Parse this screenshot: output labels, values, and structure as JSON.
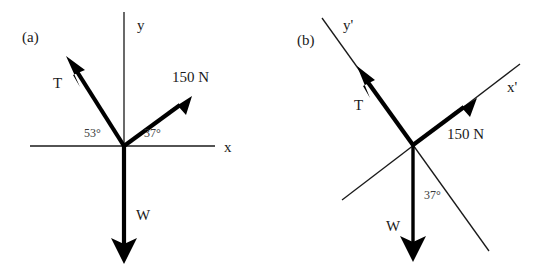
{
  "figure": {
    "background_color": "#ffffff",
    "ink_color": "#000000",
    "panels": [
      {
        "tag": "(a)",
        "tag_x": 22,
        "tag_y": 42,
        "origin": {
          "x": 124,
          "y": 146
        },
        "axes": [
          {
            "name": "x",
            "label": "x",
            "label_x": 224,
            "label_y": 152,
            "x1": 30,
            "y1": 146,
            "x2": 215,
            "y2": 146
          },
          {
            "name": "y",
            "label": "y",
            "label_x": 137,
            "label_y": 30,
            "x1": 124,
            "y1": 12,
            "x2": 124,
            "y2": 146
          }
        ],
        "vectors": [
          {
            "name": "T",
            "label": "T",
            "label_x": 53,
            "label_y": 88,
            "tip_x": 70,
            "tip_y": 63,
            "angle_deg": 53,
            "angle_label": "53°",
            "angle_label_x": 84,
            "angle_label_y": 137
          },
          {
            "name": "150 N",
            "label": "150 N",
            "label_x": 172,
            "label_y": 82,
            "tip_x": 186,
            "tip_y": 100,
            "angle_deg": 37,
            "angle_label": "37°",
            "angle_label_x": 144,
            "angle_label_y": 137
          },
          {
            "name": "W",
            "label": "W",
            "label_x": 136,
            "label_y": 220,
            "tip_x": 124,
            "tip_y": 262,
            "angle_deg": 270,
            "angle_label": "",
            "angle_label_x": 0,
            "angle_label_y": 0
          }
        ]
      },
      {
        "tag": "(b)",
        "tag_x": 297,
        "tag_y": 45,
        "origin": {
          "x": 413,
          "y": 145
        },
        "axes": [
          {
            "name": "x-prime",
            "label": "x'",
            "label_x": 507,
            "label_y": 92,
            "x1": 342,
            "y1": 200,
            "x2": 520,
            "y2": 64
          },
          {
            "name": "y-prime",
            "label": "y'",
            "label_x": 343,
            "label_y": 30,
            "x1": 322,
            "y1": 18,
            "x2": 489,
            "y2": 251
          }
        ],
        "vectors": [
          {
            "name": "T",
            "label": "T",
            "label_x": 354,
            "label_y": 110,
            "tip_x": 359,
            "tip_y": 72,
            "angle_deg": 0,
            "angle_label": "",
            "angle_label_x": 0,
            "angle_label_y": 0
          },
          {
            "name": "150 N",
            "label": "150 N",
            "label_x": 447,
            "label_y": 139,
            "tip_x": 470,
            "tip_y": 103,
            "angle_deg": 0,
            "angle_label": "",
            "angle_label_x": 0,
            "angle_label_y": 0
          },
          {
            "name": "W",
            "label": "W",
            "label_x": 386,
            "label_y": 231,
            "tip_x": 413,
            "tip_y": 260,
            "angle_deg": 270,
            "angle_label": "37°",
            "angle_label_x": 424,
            "angle_label_y": 199
          }
        ]
      }
    ]
  }
}
